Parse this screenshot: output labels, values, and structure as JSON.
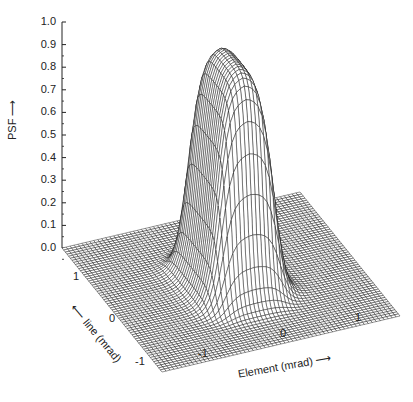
{
  "chart_data": {
    "type": "surface3d",
    "title": "",
    "zlabel": "PSF",
    "xlabel": "Element (mrad)",
    "ylabel": "line (mrad)",
    "z_ticks": [
      "0.0",
      "0.1",
      "0.2",
      "0.3",
      "0.4",
      "0.5",
      "0.6",
      "0.7",
      "0.8",
      "0.9",
      "1.0"
    ],
    "zlim": [
      0.0,
      1.0
    ],
    "x_ticks": [
      "-1",
      "0",
      "1"
    ],
    "y_ticks": [
      "1",
      "0",
      "-1"
    ],
    "xlim": [
      -1.5,
      1.5
    ],
    "ylim": [
      -1.5,
      1.5
    ],
    "peak_value": 1.0,
    "plateau_halfwidth_element_mrad": 0.35,
    "plateau_halfwidth_line_mrad": 0.6,
    "grid": true
  },
  "labels": {
    "z_axis": "PSF",
    "x_axis": "Element (mrad)",
    "y_axis": "line (mrad)",
    "arrow": "→"
  }
}
